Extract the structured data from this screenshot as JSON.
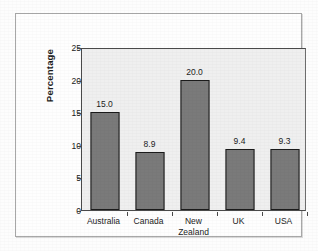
{
  "chart_data": {
    "type": "bar",
    "title": "",
    "subtitle": "",
    "xlabel": "",
    "ylabel": "Percentage",
    "categories": [
      "Australia",
      "Canada",
      "New\nZealand",
      "UK",
      "USA"
    ],
    "values": [
      15.0,
      8.9,
      20.0,
      9.4,
      9.3
    ],
    "data_labels": [
      "15.0",
      "8.9",
      "20.0",
      "9.4",
      "9.3"
    ],
    "ylim": [
      0,
      25
    ],
    "ytick_values": [
      0,
      5,
      10,
      15,
      20,
      25
    ],
    "ytick_labels": [
      "0",
      "5",
      "10",
      "15",
      "20",
      "25"
    ],
    "grid": false,
    "legend": false,
    "legend_position": "none",
    "bar_color": "#7a7a7a",
    "bar_edge_color": "#1b1b1b",
    "plot_background": "#efefef",
    "axis_color": "#4a4a4a",
    "text_color": "#1c1c1c"
  }
}
